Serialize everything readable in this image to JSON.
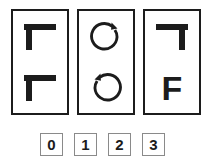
{
  "diagram": {
    "type": "visual-analogy-puzzle",
    "stroke_color": "#1c1c1c",
    "box_border_color": "#8a8a8a",
    "background_color": "#ffffff",
    "panels": [
      {
        "index": 0,
        "name": "panel-one",
        "cells": [
          {
            "position": "top",
            "glyph": "tt-shape-stem-left",
            "description": "bold horizontal bar with vertical stem descending from left end"
          },
          {
            "position": "bottom",
            "glyph": "tt-shape-stem-left",
            "description": "bold horizontal bar with vertical stem descending from left end"
          }
        ]
      },
      {
        "index": 1,
        "name": "panel-two",
        "cells": [
          {
            "position": "top",
            "glyph": "circular-arrow-clockwise",
            "description": "open circle with arrowhead at upper right"
          },
          {
            "position": "bottom",
            "glyph": "circular-arrow-counterclockwise",
            "description": "open circle with arrowhead at upper left"
          }
        ]
      },
      {
        "index": 2,
        "name": "panel-three",
        "cells": [
          {
            "position": "top",
            "glyph": "tt-shape-stem-right",
            "description": "bold horizontal bar with vertical stem descending from right end"
          },
          {
            "position": "bottom",
            "glyph": "letter-F",
            "letter": "F",
            "description": "bold capital letter F"
          }
        ]
      }
    ],
    "options": [
      {
        "index": 0,
        "label": "0"
      },
      {
        "index": 1,
        "label": "1"
      },
      {
        "index": 2,
        "label": "2"
      },
      {
        "index": 3,
        "label": "3"
      }
    ]
  }
}
